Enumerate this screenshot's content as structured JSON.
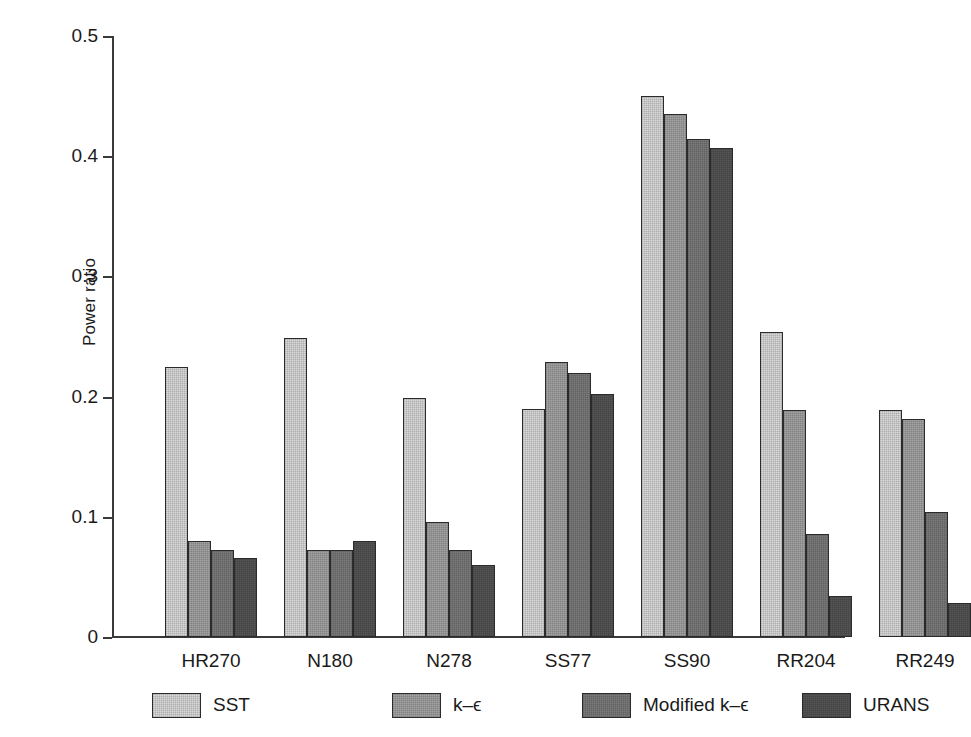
{
  "chart_data": {
    "type": "bar",
    "title": "",
    "subtitle": "",
    "xlabel": "",
    "ylabel": "Power ratio",
    "ylim": [
      0,
      0.5
    ],
    "yticks": [
      "0",
      "0.1",
      "0.2",
      "0.3",
      "0.4",
      "0.5"
    ],
    "ytick_values": [
      0,
      0.1,
      0.2,
      0.3,
      0.4,
      0.5
    ],
    "grid": false,
    "legend_position": "below-axis",
    "categories": [
      "HR270",
      "N180",
      "N278",
      "SS77",
      "SS90",
      "RR204",
      "RR249"
    ],
    "series": [
      {
        "name": "SST",
        "color": "#d9d9d9",
        "values": [
          0.225,
          0.249,
          0.199,
          0.19,
          0.45,
          0.254,
          0.189
        ]
      },
      {
        "name": "k–ϵ",
        "color": "#a3a3a3",
        "values": [
          0.08,
          0.072,
          0.096,
          0.229,
          0.435,
          0.189,
          0.181
        ]
      },
      {
        "name": "Modified k–ϵ",
        "color": "#7a7a7a",
        "values": [
          0.072,
          0.072,
          0.072,
          0.22,
          0.414,
          0.086,
          0.104
        ]
      },
      {
        "name": "URANS",
        "color": "#555555",
        "values": [
          0.066,
          0.08,
          0.06,
          0.202,
          0.407,
          0.034,
          0.028
        ]
      }
    ]
  },
  "legend": {
    "items": [
      {
        "label": "SST",
        "color": "#d9d9d9"
      },
      {
        "label": "k–ϵ",
        "color": "#a3a3a3"
      },
      {
        "label": "Modified k–ϵ",
        "color": "#7a7a7a"
      },
      {
        "label": "URANS",
        "color": "#555555"
      }
    ]
  },
  "axes": {
    "y_label": "Power ratio",
    "axis_color": "#3a3a3a"
  }
}
